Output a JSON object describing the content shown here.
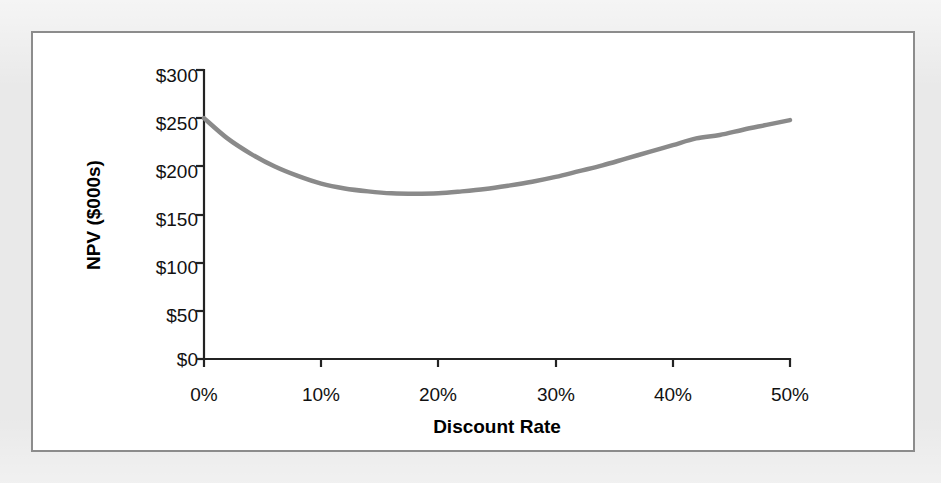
{
  "figure": {
    "background_color": "#e9e9e9",
    "panel_color": "#ffffff",
    "panel_border_color": "#8c8c8c"
  },
  "chart_data": {
    "type": "line",
    "title": "",
    "subtitle": "",
    "xlabel": "Discount Rate",
    "ylabel": "NPV ($000s)",
    "xlim": [
      0,
      50
    ],
    "ylim": [
      0,
      300
    ],
    "xticks": [
      0,
      10,
      20,
      30,
      40,
      50
    ],
    "xticklabels": [
      "0%",
      "10%",
      "20%",
      "30%",
      "40%",
      "50%"
    ],
    "yticks": [
      0,
      50,
      100,
      150,
      200,
      250,
      300
    ],
    "yticklabels": [
      "$0",
      "$50",
      "$100",
      "$150",
      "$200",
      "$250",
      "$300"
    ],
    "grid": false,
    "legend": null,
    "legend_position": "none",
    "series": [
      {
        "name": "NPV",
        "color": "#8a8a8a",
        "line_width": 4.5,
        "x": [
          0,
          2,
          4,
          6,
          8,
          10,
          12,
          14,
          16,
          18,
          20,
          22,
          24,
          26,
          28,
          30,
          32,
          34,
          36,
          38,
          40,
          42,
          44,
          46,
          48,
          50
        ],
        "y": [
          250,
          229,
          213,
          200,
          190,
          182,
          177,
          174,
          172,
          171.5,
          172,
          174,
          176.5,
          180,
          184,
          189,
          195,
          201,
          208,
          215,
          222,
          229,
          232.5,
          238,
          243,
          248
        ]
      }
    ],
    "annotations": [
      {
        "text": "minimum NPV near 18% discount rate",
        "x": 18,
        "y": 171.5
      }
    ]
  },
  "axes": {
    "x_axis_name": "x-axis",
    "y_axis_name": "y-axis",
    "tick_direction": "out",
    "axis_color": "#232323"
  }
}
